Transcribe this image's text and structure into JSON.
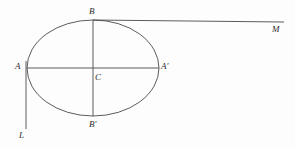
{
  "figure": {
    "background_color": "#fdfdfd",
    "stroke_color": "#4a4a4a",
    "label_color": "#2b2b2b",
    "width": 295,
    "height": 148,
    "ellipse": {
      "center_x": 93,
      "center_y": 68,
      "semi_major_x": 66,
      "semi_minor_y": 48,
      "stroke_width": 0.9
    },
    "segments": [
      {
        "name": "major-axis-A-to-Aprime",
        "x1": 27,
        "y1": 68,
        "x2": 159,
        "y2": 68,
        "stroke_width": 0.9
      },
      {
        "name": "minor-axis-B-to-Bprime",
        "x1": 93,
        "y1": 20,
        "x2": 93,
        "y2": 116,
        "stroke_width": 0.9
      },
      {
        "name": "tangent-line-B-to-M",
        "x1": 93,
        "y1": 20,
        "x2": 284,
        "y2": 22,
        "stroke_width": 0.9
      },
      {
        "name": "tangent-line-A-to-L",
        "x1": 26,
        "y1": 61,
        "x2": 26,
        "y2": 129,
        "stroke_width": 0.9
      }
    ],
    "labels": [
      {
        "id": "B",
        "text": "B",
        "x": 89,
        "y": 7
      },
      {
        "id": "M",
        "text": "M",
        "x": 272,
        "y": 25
      },
      {
        "id": "A",
        "text": "A",
        "x": 15,
        "y": 62
      },
      {
        "id": "C",
        "text": "C",
        "x": 95,
        "y": 73
      },
      {
        "id": "Ap",
        "text": "A'",
        "x": 161,
        "y": 62
      },
      {
        "id": "Bp",
        "text": "B'",
        "x": 89,
        "y": 120
      },
      {
        "id": "L",
        "text": "L",
        "x": 19,
        "y": 131
      }
    ]
  }
}
